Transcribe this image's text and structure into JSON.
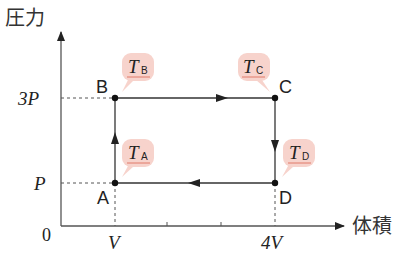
{
  "axes": {
    "y_label": "圧力",
    "x_label": "体積",
    "origin_label": "0",
    "y_ticks": [
      {
        "label": "3P"
      },
      {
        "label": "P"
      }
    ],
    "x_ticks": [
      {
        "label": "V"
      },
      {
        "label": "4V"
      }
    ]
  },
  "points": {
    "A": {
      "label": "A",
      "temp_main": "T",
      "temp_sub": "A"
    },
    "B": {
      "label": "B",
      "temp_main": "T",
      "temp_sub": "B"
    },
    "C": {
      "label": "C",
      "temp_main": "T",
      "temp_sub": "C"
    },
    "D": {
      "label": "D",
      "temp_main": "T",
      "temp_sub": "D"
    }
  },
  "cycle": [
    "A",
    "B",
    "C",
    "D",
    "A"
  ],
  "colors": {
    "line": "#333333",
    "bubble": "#f7d3cc",
    "underline": "#e07a6a"
  }
}
